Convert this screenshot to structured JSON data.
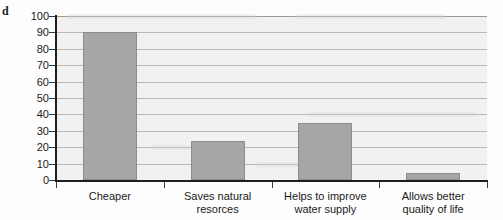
{
  "panel": {
    "label": "d"
  },
  "chart_data": {
    "type": "bar",
    "title": "",
    "subtitle": "",
    "xlabel": "",
    "ylabel": "",
    "categories": [
      "Cheaper",
      "Saves natural resorces",
      "Helps to improve water supply",
      "Allows better quality of life"
    ],
    "category_lines": [
      [
        "Cheaper"
      ],
      [
        "Saves natural",
        "resorces"
      ],
      [
        "Helps to improve",
        "water supply"
      ],
      [
        "Allows better",
        "quality of life"
      ]
    ],
    "values": [
      90,
      24,
      35,
      4
    ],
    "ylim": [
      0,
      100
    ],
    "ytick_step": 10,
    "ytick_labels": [
      "100",
      "90",
      "80",
      "70",
      "60",
      "50",
      "40",
      "30",
      "20",
      "10",
      "0"
    ],
    "ytick_values": [
      100,
      90,
      80,
      70,
      60,
      50,
      40,
      30,
      20,
      10,
      0
    ],
    "grid": true,
    "grid_orientation": "horizontal",
    "legend": false,
    "legend_position": "none",
    "bar_color": "#a6a6a6",
    "bar_edge_color": "#8e8e8e",
    "plot_background": "#f1f1f1",
    "gridline_color": "#b9b9b9",
    "axis_color": "#1e1e1e",
    "text_color": "#1b1b1b"
  }
}
